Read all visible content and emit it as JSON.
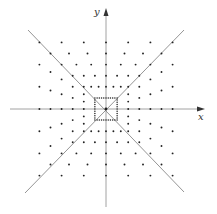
{
  "diagram": {
    "type": "point-lattice-square-rings",
    "axes": {
      "x_label": "x",
      "y_label": "y"
    },
    "diagonals": [
      "y = x",
      "y = -x"
    ],
    "rings": [
      {
        "k": 1,
        "points_per_side": 11
      },
      {
        "k": 2,
        "points_per_side": 7
      },
      {
        "k": 3,
        "points_per_side": 7
      },
      {
        "k": 4,
        "points_per_side": 7
      },
      {
        "k": 5,
        "points_per_side": 7
      },
      {
        "k": 6,
        "points_per_side": 7
      }
    ],
    "origin_point": true,
    "colors": {
      "axis": "#8a8a8a",
      "line": "#7a7a7a",
      "point": "#222222",
      "label": "#333333"
    }
  }
}
